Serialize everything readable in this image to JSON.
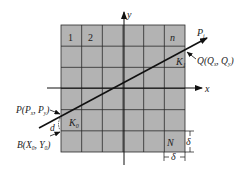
{
  "diagram": {
    "grid": {
      "rows": 6,
      "cols": 6,
      "fill": "#b3b3b3",
      "line_color": "#2a2a2a"
    },
    "cell_labels": {
      "first": "1",
      "second": "2",
      "last_in_row": "n",
      "last": "N",
      "start_cell": "K",
      "start_cell_sub": "0",
      "end_cell": "K",
      "end_cell_sub": "1"
    },
    "axes": {
      "x_label": "x",
      "y_label": "y"
    },
    "ray_label": {
      "main": "P",
      "sub": "i"
    },
    "points": {
      "P": {
        "name": "P",
        "coords": "(P",
        "sub1": "x",
        "sep": ", P",
        "sub2": "y",
        "close": ")"
      },
      "Q": {
        "name": "Q",
        "coords": "(Q",
        "sub1": "x",
        "sep": ", Q",
        "sub2": "y",
        "close": ")"
      },
      "B": {
        "name": "B",
        "coords": "(X",
        "sub1": "0",
        "sep": ", Y",
        "sub2": "0",
        "close": ")"
      }
    },
    "distance_label": "d",
    "cell_size_label": "δ"
  }
}
